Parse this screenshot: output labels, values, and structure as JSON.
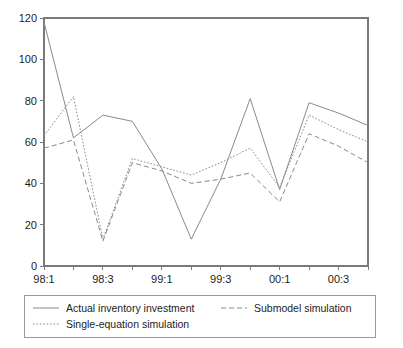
{
  "chart_data": {
    "type": "line",
    "title": "",
    "xlabel": "",
    "ylabel": "",
    "ylim": [
      0,
      120
    ],
    "yticks": [
      0,
      20,
      40,
      60,
      80,
      100,
      120
    ],
    "grid": false,
    "legend_position": "bottom",
    "x": [
      "98:1",
      "98:2",
      "98:3",
      "98:4",
      "99:1",
      "99:2",
      "99:3",
      "99:4",
      "00:1",
      "00:2",
      "00:3",
      "00:4"
    ],
    "xtick_labels": [
      "98:1",
      "98:3",
      "99:1",
      "99:3",
      "00:1",
      "00:3"
    ],
    "xtick_label_indices": [
      0,
      2,
      4,
      6,
      8,
      10
    ],
    "series": [
      {
        "name": "Actual inventory investment",
        "style": "solid",
        "color": "#8a8a8a",
        "values": [
          118,
          62,
          73,
          70,
          47,
          13,
          42,
          81,
          37,
          79,
          74,
          68
        ]
      },
      {
        "name": "Submodel simulation",
        "style": "dashed",
        "color": "#8a8a8a",
        "values": [
          57,
          61,
          12,
          50,
          46,
          40,
          42,
          45,
          31,
          64,
          58,
          50
        ]
      },
      {
        "name": "Single-equation simulation",
        "style": "dotted",
        "color": "#8a8a8a",
        "values": [
          63,
          82,
          13,
          52,
          48,
          44,
          50,
          57,
          38,
          73,
          66,
          60
        ]
      }
    ]
  },
  "legend": {
    "entries": [
      {
        "label": "Actual inventory investment",
        "style": "solid"
      },
      {
        "label": "Submodel simulation",
        "style": "dashed"
      },
      {
        "label": "Single-equation simulation",
        "style": "dotted"
      }
    ]
  },
  "colors": {
    "line": "#8a8a8a",
    "axis": "#7a7a7a",
    "text": "#1d1d1d",
    "background": "#ffffff",
    "legend_border": "#9a9a9a"
  }
}
